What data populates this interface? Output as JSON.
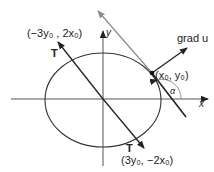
{
  "diagram": {
    "labels": {
      "upper_T_vector": "(−3y₀ , 2x₀)",
      "upper_T": "T",
      "lower_T": "T",
      "lower_T_vector": "(3y₀, −2x₀)",
      "point": "(x₀, y₀)",
      "gradient": "grad u",
      "y_axis": "y",
      "x_axis": "x",
      "angle": "α"
    },
    "colors": {
      "ink": "#222222",
      "tangent_gray": "#8a8a8a",
      "axis": "#555555"
    }
  }
}
